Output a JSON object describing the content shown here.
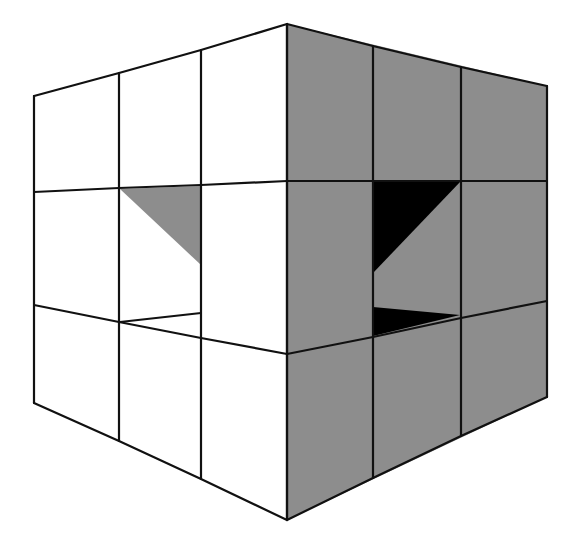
{
  "diagram": {
    "title": "",
    "colors": {
      "background": "#ffffff",
      "left_face": "#ffffff",
      "right_face": "#8d8d8d",
      "shadow_light": "#8d8d8d",
      "shadow_dark": "#000000",
      "stroke": "#111111"
    },
    "left_face": {
      "columns_x": [
        34,
        119,
        201,
        287
      ],
      "top_y": [
        96,
        73,
        50,
        24
      ],
      "row1_y": [
        192,
        188,
        185,
        181
      ],
      "row2_y": [
        305,
        322,
        338,
        354
      ],
      "bottom_y": [
        403,
        441,
        479,
        520
      ]
    },
    "right_face": {
      "columns_x": [
        287,
        373,
        461,
        547
      ],
      "top_y": [
        24,
        46,
        67,
        86
      ],
      "row1_y": [
        181,
        181,
        181,
        181
      ],
      "row2_y": [
        354,
        337,
        318,
        301
      ],
      "bottom_y": [
        520,
        478,
        436,
        397
      ]
    },
    "shapes": {
      "left_gray_triangle": "120,189 201,186 201,265",
      "left_inner_line": "120,322 201,313",
      "right_black_triangle_upper": "373,181 461,181 373,273",
      "right_black_triangle_lower": "373,307 460,315 373,336"
    }
  }
}
